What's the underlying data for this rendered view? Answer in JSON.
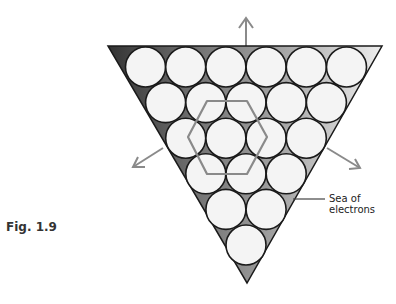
{
  "figure": {
    "label": "Fig. 1.9",
    "annotation_line1": "Sea of",
    "annotation_line2": "electrons"
  },
  "diagram": {
    "rows": [
      6,
      5,
      4,
      3,
      2,
      1
    ],
    "colors": {
      "triangle_dark": "#3a3a3a",
      "triangle_light": "#e6e6e6",
      "ion_fill": "#f4f4f4",
      "ion_stroke": "#1a1a1a",
      "hexagon_stroke": "#8a8a8a",
      "arrow_stroke": "#8a8a8a"
    },
    "arrows": [
      "up",
      "down-left",
      "down-right"
    ]
  }
}
